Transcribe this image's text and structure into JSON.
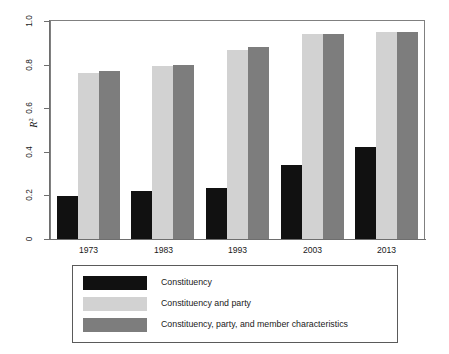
{
  "chart_data": {
    "type": "bar",
    "title": "",
    "subtitle": "",
    "xlabel": "",
    "ylabel": "R²",
    "ylabel_html": "R<sup>2</sup>",
    "categories": [
      "1973",
      "1983",
      "1993",
      "2003",
      "2013"
    ],
    "series": [
      {
        "name": "Constituency",
        "color": "#111111",
        "values": [
          0.195,
          0.222,
          0.232,
          0.338,
          0.422
        ]
      },
      {
        "name": "Constituency and party",
        "color": "#d2d2d2",
        "values": [
          0.76,
          0.793,
          0.868,
          0.94,
          0.948
        ]
      },
      {
        "name": "Constituency, party, and member characteristics",
        "color": "#7d7d7d",
        "values": [
          0.772,
          0.798,
          0.88,
          0.94,
          0.95
        ]
      }
    ],
    "ylim": [
      0,
      1.0
    ],
    "y_ticks": [
      0,
      0.2,
      0.4,
      0.6,
      0.8,
      1.0
    ],
    "y_tick_labels": [
      "0",
      "0.2",
      "0.4",
      "0.6",
      "0.8",
      "1.0"
    ],
    "grid": false,
    "legend_position": "bottom",
    "legend_entries": [
      "Constituency",
      "Constituency and party",
      "Constituency, party, and member characteristics"
    ]
  },
  "axes": {
    "y_title": "R",
    "y_title_sup": "2"
  },
  "legend": {
    "rows": [
      {
        "label": "Constituency",
        "color": "#111111"
      },
      {
        "label": "Constituency and party",
        "color": "#d2d2d2"
      },
      {
        "label": "Constituency, party, and member characteristics",
        "color": "#7d7d7d"
      }
    ]
  }
}
